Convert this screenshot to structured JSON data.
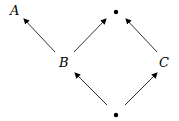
{
  "nodes": {
    "A": {
      "label": "A",
      "x": 14,
      "y": 10
    },
    "B": {
      "label": "B",
      "x": 65,
      "y": 62
    },
    "C": {
      "label": "C",
      "x": 165,
      "y": 62
    },
    "top": {
      "label": "",
      "x": 116,
      "y": 13
    },
    "bottom": {
      "label": "",
      "x": 116,
      "y": 114
    }
  },
  "edges": [
    {
      "from": "B",
      "to": "A"
    },
    {
      "from": "B",
      "to": "top"
    },
    {
      "from": "C",
      "to": "top"
    },
    {
      "from": "bottom",
      "to": "B"
    },
    {
      "from": "bottom",
      "to": "C"
    }
  ]
}
